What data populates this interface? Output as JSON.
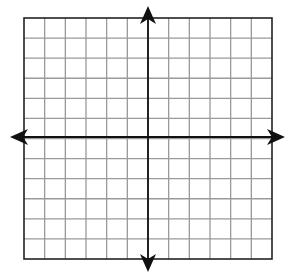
{
  "diagram": {
    "type": "coordinate-grid",
    "grid": {
      "left": 24,
      "top": 18,
      "right": 272,
      "bottom": 259,
      "columns": 12,
      "rows": 12,
      "line_color": "#9a9a9a",
      "border_color": "#222222"
    },
    "axes": {
      "x_axis_y": 137,
      "y_axis_x": 148,
      "x_extent": [
        10,
        285
      ],
      "y_extent": [
        6,
        272
      ],
      "color": "#111111",
      "arrowheads": [
        "left",
        "right",
        "up",
        "down"
      ]
    },
    "labels": []
  }
}
